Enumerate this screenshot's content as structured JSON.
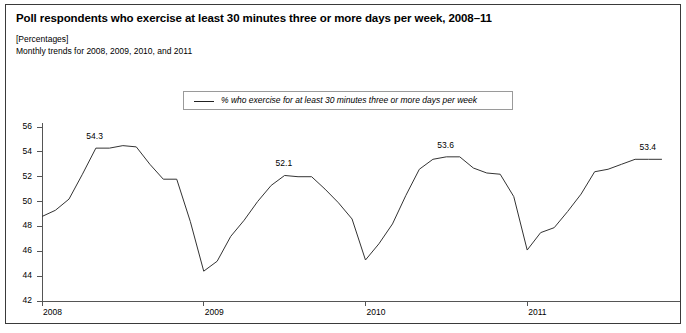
{
  "figure": {
    "title": "Poll respondents who exercise at least 30 minutes three or more days per week, 2008–11",
    "units": "[Percentages]",
    "subtitle": "Monthly trends for 2008, 2009, 2010, and 2011"
  },
  "legend": {
    "label": "% who exercise for at least 30 minutes three or more days per week"
  },
  "chart_data": {
    "type": "line",
    "title": "Poll respondents who exercise at least 30 minutes three or more days per week, 2008–11",
    "xlabel": "",
    "ylabel": "",
    "units": "Percentages",
    "grid": false,
    "legend_position": "top-center",
    "ylim": [
      42,
      56
    ],
    "yticks": [
      42,
      44,
      46,
      48,
      50,
      52,
      54,
      56
    ],
    "ytick_labels": [
      "42",
      "44",
      "46",
      "48",
      "50",
      "52",
      "54",
      "56"
    ],
    "xticks": [
      2008,
      2009,
      2010,
      2011
    ],
    "xtick_labels": [
      "2008",
      "2009",
      "2010",
      "2011"
    ],
    "xlim": [
      2008,
      2011.92
    ],
    "series": [
      {
        "name": "% who exercise for at least 30 minutes three or more days per week",
        "color": "#333333",
        "x": [
          2008.0,
          2008.083,
          2008.167,
          2008.25,
          2008.333,
          2008.417,
          2008.5,
          2008.583,
          2008.667,
          2008.75,
          2008.833,
          2008.917,
          2009.0,
          2009.083,
          2009.167,
          2009.25,
          2009.333,
          2009.417,
          2009.5,
          2009.583,
          2009.667,
          2009.75,
          2009.833,
          2009.917,
          2010.0,
          2010.083,
          2010.167,
          2010.25,
          2010.333,
          2010.417,
          2010.5,
          2010.583,
          2010.667,
          2010.75,
          2010.833,
          2010.917,
          2011.0,
          2011.083,
          2011.167,
          2011.25,
          2011.333,
          2011.417,
          2011.5,
          2011.583,
          2011.667,
          2011.75,
          2011.833
        ],
        "values": [
          48.8,
          49.3,
          50.2,
          52.2,
          54.3,
          54.3,
          54.5,
          54.4,
          53.0,
          51.8,
          51.8,
          48.4,
          44.4,
          45.2,
          47.2,
          48.5,
          50.0,
          51.3,
          52.1,
          52.0,
          52.0,
          51.0,
          49.9,
          48.6,
          45.3,
          46.6,
          48.2,
          50.5,
          52.6,
          53.4,
          53.6,
          53.6,
          52.7,
          52.3,
          52.2,
          50.4,
          46.1,
          47.5,
          47.9,
          49.2,
          50.6,
          52.4,
          52.6,
          53.0,
          53.4,
          53.4,
          53.4
        ]
      }
    ],
    "annotations": [
      {
        "text": "54.3",
        "x": 2008.33,
        "y": 54.3
      },
      {
        "text": "52.1",
        "x": 2009.5,
        "y": 52.1
      },
      {
        "text": "53.6",
        "x": 2010.5,
        "y": 53.6
      },
      {
        "text": "53.4",
        "x": 2011.75,
        "y": 53.4
      }
    ]
  }
}
